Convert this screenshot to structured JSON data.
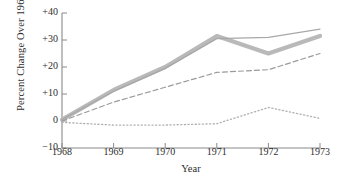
{
  "chart_data": {
    "type": "line",
    "title": "",
    "xlabel": "Year",
    "ylabel": "Percent Change Over 1968",
    "x": [
      1968,
      1969,
      1970,
      1971,
      1972,
      1973
    ],
    "categories": [
      "1968",
      "1969",
      "1970",
      "1971",
      "1972",
      "1973"
    ],
    "xtick_labels": [
      "1968",
      "1969",
      "1970",
      "1971",
      "1972",
      "1973"
    ],
    "ytick_labels": [
      "+40",
      "+30",
      "+20",
      "+10",
      "0",
      "−10"
    ],
    "ytick_values": [
      40,
      30,
      20,
      10,
      0,
      -10
    ],
    "xlim": [
      1968,
      1973
    ],
    "ylim": [
      -10,
      40
    ],
    "grid": false,
    "legend": "none",
    "series": [
      {
        "name": "thick-solid-series",
        "style": "solid-thick",
        "color": "#b9b9b9",
        "values": [
          0.5,
          11.5,
          20.0,
          31.5,
          25.0,
          31.5
        ]
      },
      {
        "name": "thin-solid-series",
        "style": "solid-thin",
        "color": "#a8a8a8",
        "values": [
          0.5,
          11.0,
          19.5,
          30.5,
          31.0,
          34.0
        ]
      },
      {
        "name": "dashed-series",
        "style": "dashed",
        "color": "#9a9a9a",
        "values": [
          0.0,
          7.0,
          12.5,
          18.0,
          19.0,
          25.0
        ]
      },
      {
        "name": "dotted-series",
        "style": "dotted",
        "color": "#b0b0b0",
        "values": [
          -0.5,
          -1.5,
          -1.5,
          -1.0,
          5.0,
          1.0
        ]
      }
    ]
  },
  "axes": {
    "y_axis_title": "Percent Change Over 1968",
    "x_axis_title": "Year",
    "y_ticks": [
      {
        "label": "+40",
        "value": 40
      },
      {
        "label": "+30",
        "value": 30
      },
      {
        "label": "+20",
        "value": 20
      },
      {
        "label": "+10",
        "value": 10
      },
      {
        "label": "0",
        "value": 0
      },
      {
        "label": "−10",
        "value": -10
      }
    ],
    "x_ticks": [
      {
        "label": "1968",
        "value": 1968
      },
      {
        "label": "1969",
        "value": 1969
      },
      {
        "label": "1970",
        "value": 1970
      },
      {
        "label": "1971",
        "value": 1971
      },
      {
        "label": "1972",
        "value": 1972
      },
      {
        "label": "1973",
        "value": 1973
      }
    ],
    "axis_color": "#8a8a8a"
  }
}
